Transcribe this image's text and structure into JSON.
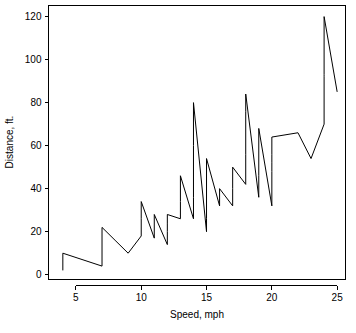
{
  "chart_data": {
    "type": "line",
    "title": "",
    "subtitle": "",
    "xlabel": "Speed, mph",
    "ylabel": "Distance, ft.",
    "xlim": [
      3.4,
      25.6
    ],
    "ylim": [
      -2,
      124
    ],
    "xticks": [
      5,
      10,
      15,
      20,
      25
    ],
    "yticks": [
      0,
      20,
      40,
      60,
      80,
      100,
      120
    ],
    "xticklabels": [
      "5",
      "10",
      "15",
      "20",
      "25"
    ],
    "yticklabels": [
      "0",
      "20",
      "40",
      "60",
      "80",
      "100",
      "120"
    ],
    "grid": false,
    "legend": null,
    "legend_position": "none",
    "line_color": "#000000",
    "line_width": 1,
    "frame": true,
    "series": [
      {
        "name": "stopping distance",
        "x": [
          4,
          4,
          7,
          7,
          8,
          9,
          10,
          10,
          10,
          11,
          11,
          12,
          12,
          12,
          12,
          13,
          13,
          13,
          13,
          14,
          14,
          14,
          14,
          15,
          15,
          15,
          16,
          16,
          17,
          17,
          17,
          18,
          18,
          18,
          18,
          19,
          19,
          19,
          20,
          20,
          20,
          20,
          20,
          22,
          23,
          24,
          24,
          24,
          24,
          25
        ],
        "y": [
          2,
          10,
          4,
          22,
          16,
          10,
          18,
          26,
          34,
          17,
          28,
          14,
          20,
          24,
          28,
          26,
          34,
          34,
          46,
          26,
          36,
          60,
          80,
          20,
          26,
          54,
          32,
          40,
          32,
          40,
          50,
          42,
          56,
          76,
          84,
          36,
          46,
          68,
          32,
          48,
          52,
          56,
          64,
          66,
          54,
          70,
          92,
          93,
          120,
          85
        ]
      }
    ],
    "n_points": 50
  },
  "figure": {
    "width": 356,
    "height": 333,
    "background": "#ffffff",
    "foreground": "#000000"
  },
  "axes": {
    "x_axis_name": "x-axis",
    "y_axis_name": "y-axis"
  }
}
